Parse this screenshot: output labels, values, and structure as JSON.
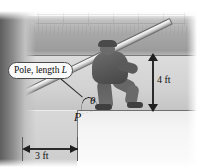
{
  "figure": {
    "callout": {
      "text_prefix": "Pole, length ",
      "symbol": "L",
      "full": "Pole, length L"
    },
    "labels": {
      "point": "P",
      "angle": "θ",
      "height_dimension": "4 ft",
      "width_dimension": "3 ft"
    },
    "colors": {
      "ink": "#1f1f1f",
      "pole_fill": "#e8e8e8",
      "pole_stroke": "#6e6e6e",
      "person_fill": "#575757",
      "wall_dark": "#989898",
      "wall_mid": "#d2d2d2",
      "floor": "#f6f6f6"
    },
    "geometry": {
      "pole_angle_label": "θ",
      "horizontal_offset": "3 ft",
      "vertical_offset": "4 ft",
      "pole_length_symbol": "L"
    }
  }
}
